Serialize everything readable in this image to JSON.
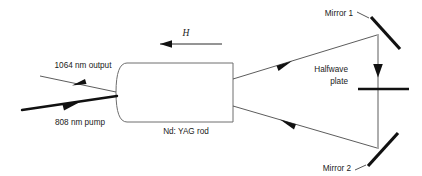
{
  "figure": {
    "background_color": "#ffffff",
    "ink_color": "#111111",
    "beam_color": "#4a4a4a",
    "width": 422,
    "height": 176
  },
  "labels": {
    "output_beam": "1064 nm output",
    "pump_beam": "808 nm pump",
    "gain_medium": "Nd: YAG rod",
    "field_symbol": "H",
    "mirror_one": "Mirror 1",
    "mirror_two": "Mirror 2",
    "halfwave_plate_line1": "Halfwave",
    "halfwave_plate_line2": "plate"
  },
  "components": [
    {
      "name": "nd-yag-rod",
      "label": "Nd: YAG rod",
      "shape": "rounded-left-rectangle"
    },
    {
      "name": "mirror-1",
      "label": "Mirror 1",
      "shape": "tilted-line"
    },
    {
      "name": "mirror-2",
      "label": "Mirror 2",
      "shape": "tilted-line"
    },
    {
      "name": "halfwave-plate",
      "label": "Halfwave plate",
      "shape": "horizontal-line"
    }
  ],
  "beams": [
    {
      "name": "output-beam-1064",
      "label": "1064 nm output",
      "direction": "leftward",
      "weight": "thin"
    },
    {
      "name": "pump-beam-808",
      "label": "808 nm pump",
      "direction": "rightward",
      "weight": "thick"
    },
    {
      "name": "upper-cavity-beam",
      "direction": "rightward-up",
      "weight": "thin"
    },
    {
      "name": "lower-cavity-beam",
      "direction": "leftward-up",
      "weight": "thin"
    },
    {
      "name": "vertical-cavity-beam",
      "direction": "downward",
      "weight": "thin"
    }
  ],
  "annotations": {
    "magnetic-field-arrow": {
      "symbol": "H",
      "direction": "leftward"
    }
  }
}
